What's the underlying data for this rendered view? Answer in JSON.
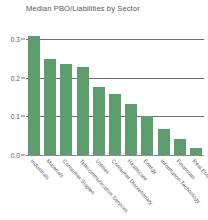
{
  "chart_data": {
    "type": "bar",
    "title": "Median PBO/Liabilities by Sector",
    "xlabel": "",
    "ylabel": "",
    "ylim": [
      0.0,
      0.3
    ],
    "yticks": [
      "0.0",
      "0.1",
      "0.2",
      "0.3"
    ],
    "ytick_values": [
      0.0,
      0.1,
      0.2,
      0.3
    ],
    "grid": true,
    "legend": "none",
    "bar_color": "#5e9e6e",
    "categories": [
      "Industrials",
      "Materials",
      "Consumer Staples",
      "Telecommunication Services",
      "Utilities",
      "Consumer Discretionary",
      "Healthcare",
      "Energy",
      "Information Technology",
      "Financials",
      "Real Estate"
    ],
    "values": [
      0.308,
      0.248,
      0.235,
      0.227,
      0.177,
      0.158,
      0.133,
      0.101,
      0.068,
      0.042,
      0.018
    ]
  }
}
